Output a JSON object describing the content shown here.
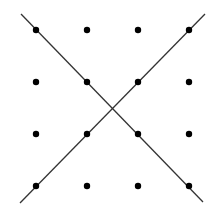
{
  "diagram": {
    "type": "dot-grid-with-crossing-lines",
    "grid": {
      "rows": 4,
      "cols": 4,
      "x": [
        36,
        87,
        138,
        189
      ],
      "y": [
        30,
        82,
        134,
        186
      ],
      "dot_radius": 3.2,
      "dot_color": "#000000"
    },
    "lines": [
      {
        "name": "descending-diagonal",
        "x1": 21,
        "y1": 14,
        "x2": 203,
        "y2": 202
      },
      {
        "name": "ascending-diagonal",
        "x1": 205,
        "y1": 14,
        "x2": 20,
        "y2": 203
      }
    ],
    "line_color": "#333333",
    "background": "#ffffff"
  }
}
